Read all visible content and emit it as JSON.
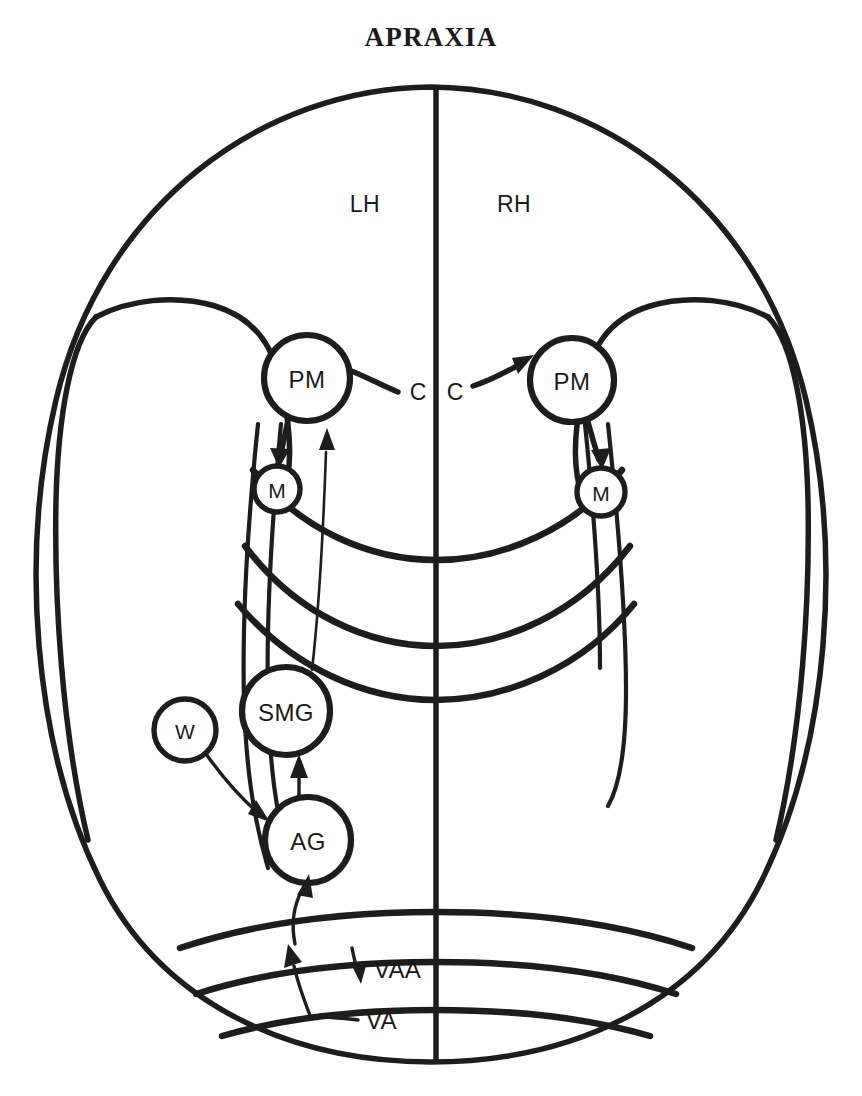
{
  "figure": {
    "title": "APRAXIA",
    "background_color": "#ffffff",
    "ink_color": "#1d1d1d"
  },
  "hemispheres": [
    {
      "id": "left",
      "label": "LH"
    },
    {
      "id": "right",
      "label": "RH"
    }
  ],
  "nodes": [
    {
      "id": "pm-left",
      "label": "PM",
      "hemisphere": "left",
      "cx": 307,
      "cy": 378,
      "r": 43
    },
    {
      "id": "pm-right",
      "label": "PM",
      "hemisphere": "right",
      "cx": 572,
      "cy": 380,
      "r": 42
    },
    {
      "id": "m-left",
      "label": "M",
      "hemisphere": "left",
      "cx": 277,
      "cy": 489,
      "r": 23
    },
    {
      "id": "m-right",
      "label": "M",
      "hemisphere": "right",
      "cx": 601,
      "cy": 492,
      "r": 24
    },
    {
      "id": "smg",
      "label": "SMG",
      "hemisphere": "left",
      "cx": 286,
      "cy": 711,
      "r": 44
    },
    {
      "id": "w",
      "label": "W",
      "hemisphere": "left",
      "cx": 185,
      "cy": 730,
      "r": 31
    },
    {
      "id": "ag",
      "label": "AG",
      "hemisphere": "left",
      "cx": 308,
      "cy": 840,
      "r": 43
    }
  ],
  "annotations": [
    {
      "id": "cc-left",
      "label": "C",
      "x": 418,
      "y": 392
    },
    {
      "id": "cc-right",
      "label": "C",
      "x": 455,
      "y": 392
    },
    {
      "id": "vaa",
      "label": "VAA",
      "x": 374,
      "y": 969
    },
    {
      "id": "va",
      "label": "VA",
      "x": 366,
      "y": 1020
    }
  ],
  "connections": [
    {
      "id": "pm-left-to-pm-right",
      "from": "pm-left",
      "to": "pm-right",
      "via": "corpus-callosum"
    },
    {
      "id": "pm-left-to-m-left",
      "from": "pm-left",
      "to": "m-left"
    },
    {
      "id": "pm-right-to-m-right",
      "from": "pm-right",
      "to": "m-right"
    },
    {
      "id": "smg-to-pm-left",
      "from": "smg",
      "to": "pm-left"
    },
    {
      "id": "ag-to-smg",
      "from": "ag",
      "to": "smg"
    },
    {
      "id": "w-to-ag",
      "from": "w",
      "to": "ag"
    },
    {
      "id": "va-to-ag",
      "from": "va",
      "to": "ag"
    }
  ]
}
